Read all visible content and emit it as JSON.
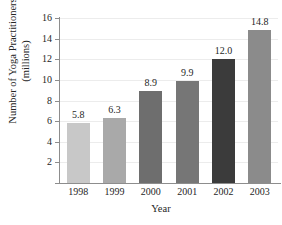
{
  "chart_data": {
    "type": "bar",
    "title": "",
    "categories": [
      "1998",
      "1999",
      "2000",
      "2001",
      "2002",
      "2003"
    ],
    "values": [
      5.8,
      6.3,
      8.9,
      9.9,
      12.0,
      14.8
    ],
    "value_labels": [
      "5.8",
      "6.3",
      "8.9",
      "9.9",
      "12.0",
      "14.8"
    ],
    "xlabel": "Year",
    "ylabel_line1": "Number of Yoga Practitioners",
    "ylabel_line2": "(millions)",
    "ylim": [
      0,
      16
    ],
    "ytick_labels": [
      "2",
      "4",
      "6",
      "8",
      "10",
      "12",
      "14",
      "16"
    ],
    "ytick_values": [
      2,
      4,
      6,
      8,
      10,
      12,
      14,
      16
    ],
    "grid": true,
    "legend": "none",
    "bar_colors": [
      "#c8c8c8",
      "#a9a9a9",
      "#6e6e6e",
      "#767676",
      "#3b3b3b",
      "#8b8b8b"
    ],
    "axis_color": "#8d8d8d",
    "gridline_color": "#ececec"
  }
}
